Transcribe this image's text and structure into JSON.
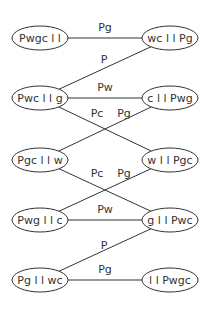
{
  "diagram": {
    "type": "state-transition-graph",
    "nodes": [
      {
        "id": "n1",
        "label": "Pwgc||",
        "display": "Pwgc l l",
        "cx": 40,
        "cy": 38
      },
      {
        "id": "n2",
        "label": "wc||Pg",
        "display": "wc l l Pg",
        "cx": 170,
        "cy": 38
      },
      {
        "id": "n3",
        "label": "Pwc||g",
        "display": "Pwc l l g",
        "cx": 40,
        "cy": 98
      },
      {
        "id": "n4",
        "label": "c||Pwg",
        "display": "c l l Pwg",
        "cx": 170,
        "cy": 98
      },
      {
        "id": "n5",
        "label": "Pgc||w",
        "display": "Pgc l l w",
        "cx": 40,
        "cy": 160
      },
      {
        "id": "n6",
        "label": "w||Pgc",
        "display": "w l l Pgc",
        "cx": 170,
        "cy": 160
      },
      {
        "id": "n7",
        "label": "Pwg||c",
        "display": "Pwg l l c",
        "cx": 40,
        "cy": 220
      },
      {
        "id": "n8",
        "label": "g||Pwc",
        "display": "g l l Pwc",
        "cx": 170,
        "cy": 220
      },
      {
        "id": "n9",
        "label": "Pg||wc",
        "display": "Pg l l wc",
        "cx": 40,
        "cy": 280
      },
      {
        "id": "n10",
        "label": "||Pwgc",
        "display": "l l Pwgc",
        "cx": 170,
        "cy": 280
      }
    ],
    "edges": [
      {
        "from": "n1",
        "to": "n2",
        "label": "Pg",
        "lx": 105,
        "ly": 31
      },
      {
        "from": "n3",
        "to": "n2",
        "label": "P",
        "lx": 104,
        "ly": 63
      },
      {
        "from": "n3",
        "to": "n4",
        "label": "Pw",
        "lx": 105,
        "ly": 91
      },
      {
        "from": "n3",
        "to": "n6",
        "label": "Pc",
        "lx": 97,
        "ly": 117
      },
      {
        "from": "n5",
        "to": "n4",
        "label": "Pg",
        "lx": 124,
        "ly": 117
      },
      {
        "from": "n5",
        "to": "n8",
        "label": "Pc",
        "lx": 97,
        "ly": 177
      },
      {
        "from": "n7",
        "to": "n6",
        "label": "Pg",
        "lx": 124,
        "ly": 177
      },
      {
        "from": "n7",
        "to": "n8",
        "label": "Pw",
        "lx": 105,
        "ly": 213
      },
      {
        "from": "n9",
        "to": "n8",
        "label": "P",
        "lx": 104,
        "ly": 249
      },
      {
        "from": "n9",
        "to": "n10",
        "label": "Pg",
        "lx": 105,
        "ly": 273
      }
    ]
  }
}
